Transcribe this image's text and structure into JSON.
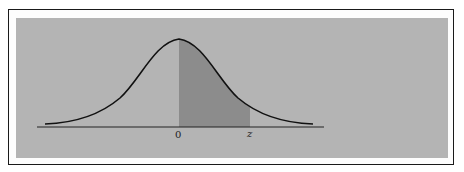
{
  "diagram": {
    "type": "standard-normal-curve",
    "labels": {
      "origin": "0",
      "z": "z"
    },
    "colors": {
      "background": "#b4b4b4",
      "shaded_region": "#8c8c8c",
      "curve": "#111111",
      "frame": "#1a1a1a"
    },
    "shaded_interval": [
      "0",
      "z"
    ]
  }
}
